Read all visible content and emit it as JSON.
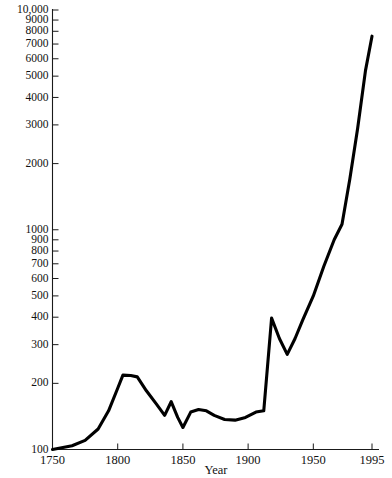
{
  "chart_data": {
    "type": "line",
    "title": "",
    "subtitle": "",
    "xlabel": "Year",
    "ylabel": "",
    "yscale": "log",
    "xscale": "linear",
    "grid": false,
    "legend": null,
    "xlim": [
      1750,
      1995
    ],
    "ylim": [
      100,
      10000
    ],
    "xticks": [
      1750,
      1800,
      1850,
      1900,
      1950,
      1995
    ],
    "xtick_labels": [
      "1750",
      "1800",
      "1850",
      "1900",
      "1950",
      "1995"
    ],
    "yticks": [
      100,
      200,
      300,
      400,
      500,
      600,
      700,
      800,
      900,
      1000,
      2000,
      3000,
      4000,
      5000,
      6000,
      7000,
      8000,
      9000,
      10000
    ],
    "ytick_labels": [
      "100",
      "200",
      "300",
      "400",
      "500",
      "600",
      "700",
      "800",
      "900",
      "1000",
      "2000",
      "3000",
      "4000",
      "5000",
      "6000",
      "7000",
      "8000",
      "9000",
      "10,000"
    ],
    "series": [
      {
        "name": "value",
        "color": "#000000",
        "x": [
          1750,
          1765,
          1775,
          1785,
          1793,
          1800,
          1804,
          1810,
          1815,
          1822,
          1830,
          1836,
          1841,
          1846,
          1850,
          1856,
          1862,
          1868,
          1874,
          1882,
          1890,
          1898,
          1906,
          1912,
          1918,
          1924,
          1930,
          1936,
          1942,
          1950,
          1958,
          1966,
          1972,
          1978,
          1984,
          1990,
          1995
        ],
        "y": [
          100,
          104,
          110,
          124,
          150,
          190,
          218,
          217,
          214,
          185,
          160,
          143,
          165,
          140,
          126,
          148,
          152,
          150,
          143,
          137,
          136,
          140,
          148,
          150,
          396,
          320,
          271,
          320,
          390,
          500,
          680,
          900,
          1060,
          1700,
          2900,
          5300,
          7600
        ]
      }
    ]
  },
  "artifacts": {
    "top_left_smudge": "",
    "top_right_smudge": ""
  }
}
